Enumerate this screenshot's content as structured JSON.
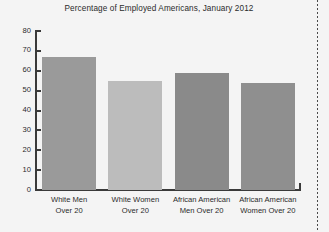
{
  "chart_data": {
    "type": "bar",
    "title": "Percentage of Employed Americans, January 2012",
    "xlabel": "",
    "ylabel": "",
    "ylim": [
      0,
      80
    ],
    "yticks": [
      0,
      10,
      20,
      30,
      40,
      50,
      60,
      70,
      80
    ],
    "grid": false,
    "legend": "none",
    "categories": [
      "White Men Over 20",
      "White Women Over 20",
      "African American Men Over 20",
      "African American Women Over 20"
    ],
    "category_lines": [
      [
        "White Men",
        "Over 20"
      ],
      [
        "White Women",
        "Over 20"
      ],
      [
        "African American",
        "Men Over 20"
      ],
      [
        "African American",
        "Women Over 20"
      ]
    ],
    "values": [
      67,
      55,
      59,
      54
    ],
    "bar_colors": [
      "#9a9a9a",
      "#bcbcbc",
      "#8a8a8a",
      "#8f8f8f"
    ]
  },
  "colors": {
    "background": "#f4f4f4",
    "axis": "#3a3a3a",
    "text": "#2b2b2b",
    "rule": "#4a4a4a"
  }
}
